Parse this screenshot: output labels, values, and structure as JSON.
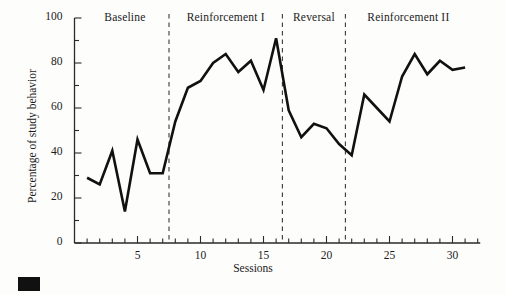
{
  "figure": {
    "marker_name": "black-square-marker"
  },
  "axes": {
    "y_title": "Percentage of study behavior",
    "x_title": "Sessions",
    "y_ticks": [
      0,
      20,
      40,
      60,
      80,
      100
    ],
    "y_tick_labels": [
      "0",
      "20",
      "40",
      "60",
      "80",
      "100"
    ],
    "x_tick_labels": [
      "5",
      "10",
      "15",
      "20",
      "25",
      "30"
    ],
    "x_tick_values": [
      5,
      10,
      15,
      20,
      25,
      30
    ]
  },
  "chart_data": {
    "type": "line",
    "title": "",
    "subtitle": "",
    "xlabel": "Sessions",
    "ylabel": "Percentage of study behavior",
    "xlim": [
      0,
      32
    ],
    "ylim": [
      0,
      100
    ],
    "grid": false,
    "legend_position": "none",
    "line_color": "#111111",
    "line_width": 2.6,
    "x": [
      1,
      2,
      3,
      4,
      5,
      6,
      7,
      8,
      9,
      10,
      11,
      12,
      13,
      14,
      15,
      16,
      17,
      18,
      19,
      20,
      21,
      22,
      23,
      24,
      25,
      26,
      27,
      28,
      29,
      30,
      31
    ],
    "series": [
      {
        "name": "Percentage of study behavior",
        "values": [
          29,
          26,
          41,
          14,
          46,
          31,
          31,
          54,
          69,
          72,
          80,
          84,
          76,
          81,
          68,
          91,
          59,
          47,
          53,
          51,
          44,
          39,
          66,
          60,
          54,
          74,
          84,
          75,
          81,
          77,
          78
        ]
      }
    ],
    "phases": [
      {
        "name": "Baseline",
        "start": 1,
        "end": 7,
        "label_x": 4
      },
      {
        "name": "Reinforcement I",
        "start": 8,
        "end": 16,
        "label_x": 12
      },
      {
        "name": "Reversal",
        "start": 17,
        "end": 21,
        "label_x": 19
      },
      {
        "name": "Reinforcement II",
        "start": 22,
        "end": 31,
        "label_x": 26.5
      }
    ],
    "phase_dividers": [
      7.5,
      16.5,
      21.5
    ]
  }
}
